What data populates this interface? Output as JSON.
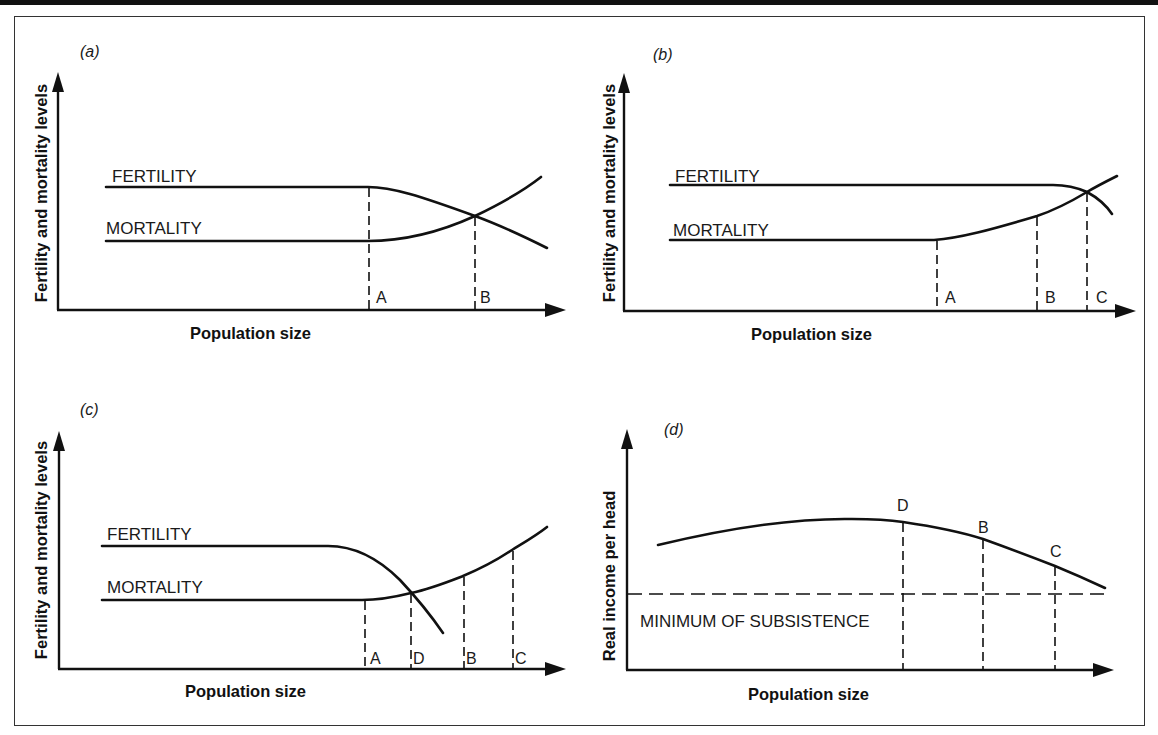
{
  "figure": {
    "colors": {
      "ink": "#111111",
      "background": "#ffffff",
      "frame": "#333333"
    },
    "panels": [
      {
        "id": "a",
        "tag": "(a)",
        "ylabel": "Fertility and mortality levels",
        "xlabel": "Population size",
        "series": [
          {
            "name": "FERTILITY",
            "label": "FERTILITY"
          },
          {
            "name": "MORTALITY",
            "label": "MORTALITY"
          }
        ],
        "markers": [
          "A",
          "B"
        ]
      },
      {
        "id": "b",
        "tag": "(b)",
        "ylabel": "Fertility and mortality levels",
        "xlabel": "Population size",
        "series": [
          {
            "name": "FERTILITY",
            "label": "FERTILITY"
          },
          {
            "name": "MORTALITY",
            "label": "MORTALITY"
          }
        ],
        "markers": [
          "A",
          "B",
          "C"
        ]
      },
      {
        "id": "c",
        "tag": "(c)",
        "ylabel": "Fertility and mortality levels",
        "xlabel": "Population size",
        "series": [
          {
            "name": "FERTILITY",
            "label": "FERTILITY"
          },
          {
            "name": "MORTALITY",
            "label": "MORTALITY"
          }
        ],
        "markers": [
          "A",
          "D",
          "B",
          "C"
        ]
      },
      {
        "id": "d",
        "tag": "(d)",
        "ylabel": "Real income per head",
        "xlabel": "Population size",
        "reference_line": "MINIMUM OF SUBSISTENCE",
        "markers": [
          "D",
          "B",
          "C"
        ]
      }
    ]
  }
}
